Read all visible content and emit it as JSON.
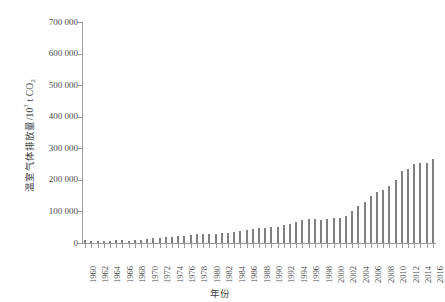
{
  "chart_data": {
    "type": "bar",
    "title": "",
    "subtitle": "",
    "xlabel": "年份",
    "ylabel": "温室气体排放量/10³ t CO₂",
    "ylabel_parts": {
      "prefix": "温室气体排放量/10",
      "exponent": "3",
      "suffix": " t CO",
      "subscript": "2"
    },
    "ylim": [
      0,
      700000
    ],
    "ytick_values": [
      0,
      100000,
      200000,
      300000,
      400000,
      500000,
      600000,
      700000
    ],
    "ytick_labels": [
      "0",
      "100 000",
      "200 000",
      "300 000",
      "400 000",
      "500 000",
      "600 000",
      "700 000"
    ],
    "xlim": [
      1959.5,
      2016.5
    ],
    "xtick_labels": [
      "1960",
      "1962",
      "1964",
      "1966",
      "1968",
      "1970",
      "1972",
      "1974",
      "1976",
      "1978",
      "1980",
      "1982",
      "1984",
      "1986",
      "1988",
      "1990",
      "1992",
      "1994",
      "1996",
      "1998",
      "2000",
      "2002",
      "2004",
      "2006",
      "2008",
      "2010",
      "2012",
      "2014",
      "2016"
    ],
    "xtick_label_step_years": 2,
    "grid": false,
    "legend": null,
    "bar_color": "#808080",
    "axis_color": "#9a9a9a",
    "categories": [
      1960,
      1961,
      1962,
      1963,
      1964,
      1965,
      1966,
      1967,
      1968,
      1969,
      1970,
      1971,
      1972,
      1973,
      1974,
      1975,
      1976,
      1977,
      1978,
      1979,
      1980,
      1981,
      1982,
      1983,
      1984,
      1985,
      1986,
      1987,
      1988,
      1989,
      1990,
      1991,
      1992,
      1993,
      1994,
      1995,
      1996,
      1997,
      1998,
      1999,
      2000,
      2001,
      2002,
      2003,
      2004,
      2005,
      2006,
      2007,
      2008,
      2009,
      2010,
      2011,
      2012,
      2013,
      2014,
      2015,
      2016
    ],
    "values": [
      8000,
      6500,
      5500,
      6000,
      7000,
      8500,
      9000,
      7500,
      8500,
      11000,
      14000,
      16000,
      17000,
      18000,
      19000,
      22000,
      22000,
      25000,
      28000,
      29000,
      29000,
      29000,
      31000,
      33000,
      36000,
      39000,
      42000,
      45000,
      48000,
      49000,
      50000,
      52000,
      56000,
      60000,
      65000,
      72000,
      75000,
      76000,
      73000,
      76000,
      78000,
      80000,
      85000,
      100000,
      116000,
      131000,
      148000,
      161000,
      168000,
      181000,
      199000,
      227000,
      235000,
      250000,
      254000,
      253000,
      267000
    ]
  }
}
